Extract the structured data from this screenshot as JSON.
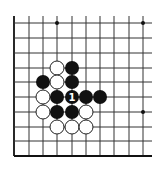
{
  "diagram": {
    "type": "go-board-fragment",
    "width": 163,
    "height": 170,
    "colors": {
      "background": "#ffffff",
      "line": "#333333",
      "black_stone": "#111111",
      "white_stone": "#ffffff"
    },
    "grid": {
      "columns_x": [
        14,
        29,
        43,
        57,
        72,
        86,
        100,
        114,
        129,
        143
      ],
      "rows_y": [
        23,
        38,
        53,
        68,
        82,
        97,
        112,
        127,
        141,
        156
      ],
      "open_top_y": 16,
      "open_right_x": 152,
      "edges": [
        "left",
        "bottom"
      ]
    },
    "star_points": [
      {
        "col": 3,
        "row": 0
      },
      {
        "col": 9,
        "row": 0
      },
      {
        "col": 9,
        "row": 6
      }
    ],
    "stone_radius": 7,
    "stones": [
      {
        "col": 3,
        "row": 3,
        "color": "white"
      },
      {
        "col": 4,
        "row": 3,
        "color": "black"
      },
      {
        "col": 2,
        "row": 4,
        "color": "black"
      },
      {
        "col": 3,
        "row": 4,
        "color": "white"
      },
      {
        "col": 4,
        "row": 4,
        "color": "black"
      },
      {
        "col": 2,
        "row": 5,
        "color": "white"
      },
      {
        "col": 3,
        "row": 5,
        "color": "black"
      },
      {
        "col": 4,
        "row": 5,
        "color": "black",
        "label": "1"
      },
      {
        "col": 5,
        "row": 5,
        "color": "black"
      },
      {
        "col": 6,
        "row": 5,
        "color": "black"
      },
      {
        "col": 2,
        "row": 6,
        "color": "white"
      },
      {
        "col": 3,
        "row": 6,
        "color": "black"
      },
      {
        "col": 4,
        "row": 6,
        "color": "black"
      },
      {
        "col": 5,
        "row": 6,
        "color": "white"
      },
      {
        "col": 3,
        "row": 7,
        "color": "white"
      },
      {
        "col": 4,
        "row": 7,
        "color": "white"
      },
      {
        "col": 5,
        "row": 7,
        "color": "white"
      }
    ]
  }
}
